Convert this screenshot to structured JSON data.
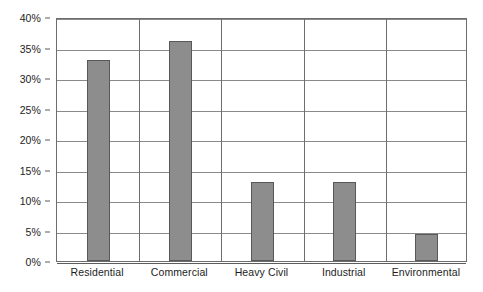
{
  "chart_data": {
    "type": "bar",
    "title": "",
    "subtitle": "",
    "xlabel": "",
    "ylabel": "",
    "categories": [
      "Residential",
      "Commercial",
      "Heavy Civil",
      "Industrial",
      "Environmental"
    ],
    "values": [
      33,
      36,
      13,
      13,
      4.5
    ],
    "value_labels": [
      "33%",
      "36%",
      "13%",
      "13%",
      "4.5%"
    ],
    "ylim": [
      0,
      40
    ],
    "ytick_values": [
      0,
      5,
      10,
      15,
      20,
      25,
      30,
      35,
      40
    ],
    "ytick_labels": [
      "0%",
      "5%",
      "10%",
      "15%",
      "20%",
      "25%",
      "30%",
      "35%",
      "40%"
    ],
    "grid": true,
    "grid_axis": "both",
    "legend": false,
    "legend_position": "none",
    "series": [
      {
        "name": "Share",
        "values": [
          33,
          36,
          13,
          13,
          4.5
        ]
      }
    ],
    "colors": {
      "bar_fill": "#8d8d8d",
      "bar_border": "#585858",
      "gridline": "#8a8a8a",
      "axis": "#5d5d5d",
      "plot_border": "#6d6d6d",
      "background": "#ffffff",
      "text": "#1d1d1d"
    }
  }
}
